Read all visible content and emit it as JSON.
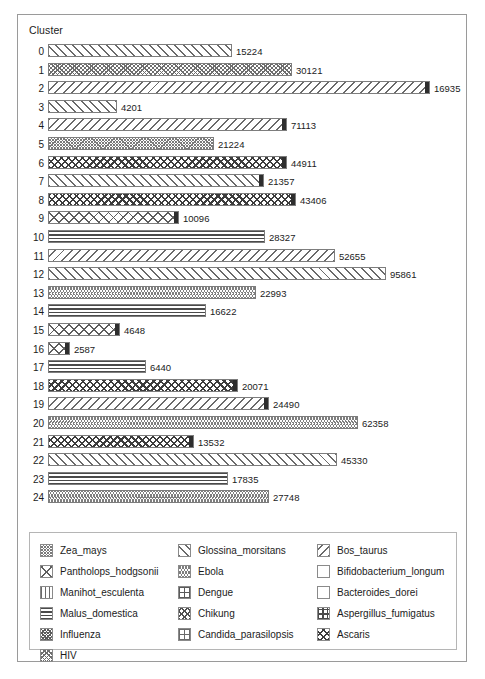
{
  "chart_data": {
    "type": "bar",
    "title": "",
    "xlabel": "",
    "ylabel": "Cluster",
    "orientation": "horizontal",
    "grid": false,
    "legend_position": "bottom",
    "axis_title": "Cluster",
    "categories": [
      "0",
      "1",
      "2",
      "3",
      "4",
      "5",
      "6",
      "7",
      "8",
      "9",
      "10",
      "11",
      "12",
      "13",
      "14",
      "15",
      "16",
      "17",
      "18",
      "19",
      "20",
      "21",
      "22",
      "23",
      "24"
    ],
    "values": [
      15224,
      30121,
      16935,
      4201,
      71113,
      21224,
      44911,
      21357,
      43406,
      10096,
      28327,
      52655,
      95861,
      22993,
      16622,
      4648,
      2587,
      6440,
      20071,
      24490,
      62358,
      13532,
      45330,
      17835,
      27748
    ],
    "value_labels": [
      "15224",
      "30121",
      "16935",
      "4201",
      "71113",
      "21224",
      "44911",
      "21357",
      "43406",
      "10096",
      "28327",
      "52655",
      "95861",
      "22993",
      "16622",
      "4648",
      "2587",
      "6440",
      "20071",
      "24490",
      "62358",
      "13532",
      "45330",
      "17835",
      "27748"
    ],
    "bar_pixel_widths": [
      184,
      244,
      382,
      69,
      239,
      166,
      239,
      216,
      248,
      131,
      217,
      287,
      338,
      208,
      158,
      72,
      22,
      98,
      190,
      221,
      310,
      146,
      289,
      180,
      221
    ],
    "bar_patterns": [
      "diag-fwd",
      "zigzag-dense",
      "diag-back",
      "diag-fwd",
      "diag-back",
      "fine-net",
      "diamond-blk",
      "diag-fwd",
      "diamond-blk",
      "crosshatch-lg",
      "horiz",
      "diag-back",
      "diag-fwd",
      "wave",
      "horiz",
      "crosshatch-lg",
      "crosshatch-lg",
      "horiz",
      "diamond-blk",
      "diag-back",
      "wave",
      "diamond-blk",
      "diag-fwd",
      "horiz",
      "wave"
    ],
    "bar_has_dark_cap": [
      false,
      false,
      true,
      false,
      true,
      false,
      true,
      true,
      true,
      true,
      false,
      false,
      false,
      false,
      false,
      true,
      true,
      false,
      true,
      true,
      false,
      true,
      false,
      false,
      false
    ],
    "legend": [
      {
        "label": "Zea_mays",
        "pattern": "fine-net"
      },
      {
        "label": "Pantholops_hodgsonii",
        "pattern": "crosshatch-lg"
      },
      {
        "label": "Manihot_esculenta",
        "pattern": "vert"
      },
      {
        "label": "Malus_domestica",
        "pattern": "horiz"
      },
      {
        "label": "Influenza",
        "pattern": "dotty"
      },
      {
        "label": "HIV",
        "pattern": "zigzag-dense"
      },
      {
        "label": "Glossina_morsitans",
        "pattern": "diag-fwd"
      },
      {
        "label": "Ebola",
        "pattern": "wave"
      },
      {
        "label": "Dengue",
        "pattern": "grid-sq"
      },
      {
        "label": "Chikung",
        "pattern": "bowtie"
      },
      {
        "label": "Candida_parasilopsis",
        "pattern": "dash-box"
      },
      {
        "label": "Bos_taurus",
        "pattern": "diag-back"
      },
      {
        "label": "Bifidobacterium_longum",
        "pattern": "empty"
      },
      {
        "label": "Bacteroides_dorei",
        "pattern": "solid"
      },
      {
        "label": "Aspergillus_fumigatus",
        "pattern": "plus"
      },
      {
        "label": "Ascaris",
        "pattern": "diamond-blk"
      }
    ]
  },
  "colors": {
    "frame_border": "#9a9a9a",
    "bar_outline": "#7d7d7d",
    "hatch": "#6a6a6a",
    "text": "#1b1b1b",
    "background": "#ffffff"
  }
}
